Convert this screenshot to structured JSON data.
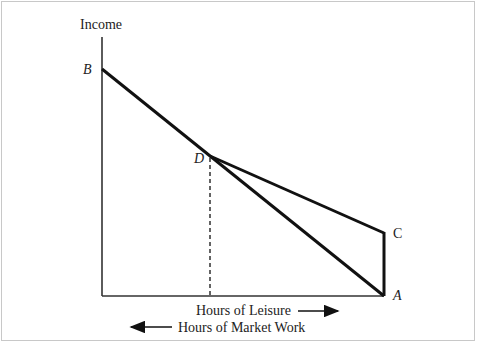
{
  "diagram": {
    "y_axis_label": "Income",
    "x_axis_label_right": "Hours of Leisure",
    "x_axis_label_left": "Hours of Market Work",
    "points": {
      "B": "B",
      "D": "D",
      "C": "C",
      "A": "A"
    },
    "lines": [
      {
        "name": "budget-line-B-A",
        "from": "B",
        "to": "A"
      },
      {
        "name": "kinked-line-D-C",
        "from": "D",
        "to": "C"
      },
      {
        "name": "vertical-segment-C-A",
        "from": "C",
        "to": "A"
      },
      {
        "name": "dashed-drop-D",
        "from": "D",
        "to": "x-axis",
        "style": "dashed"
      }
    ],
    "colors": {
      "line": "#111111",
      "text": "#222222",
      "frame": "#c8c8c8"
    }
  }
}
